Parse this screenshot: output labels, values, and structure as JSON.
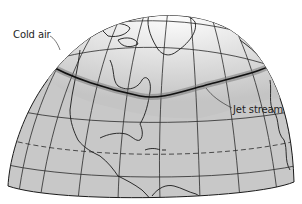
{
  "figure": {
    "type": "globe-hemisphere-diagram"
  },
  "labels": {
    "cold_air": "Cold air",
    "jet_stream": "Jet stream"
  },
  "colors": {
    "background": "#ffffff",
    "land_sea_fill": "#c8c8c8",
    "polar_fill_light": "#f2f2f2",
    "grid_line": "#2a2a2a",
    "jet_stream_line": "#111111",
    "outline": "#1a1a1a",
    "text": "#1e1e1e"
  },
  "features": {
    "graticule": "latitude/longitude grid",
    "equator_line": "dashed line (Tropic of Cancer)",
    "jet_stream_band": "thick dark wavy line circling the north pole",
    "continents": [
      "North America",
      "Greenland",
      "Central America",
      "Caribbean islands",
      "northern South America",
      "western Europe/Africa edge"
    ]
  }
}
